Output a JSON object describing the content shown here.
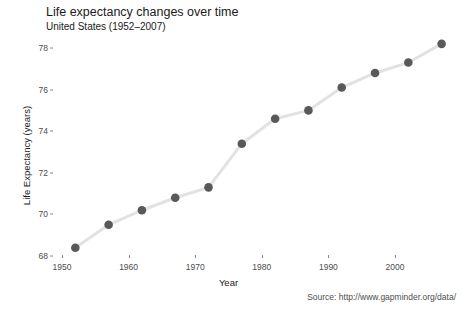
{
  "chart_data": {
    "type": "line",
    "title": "Life expectancy changes over time",
    "subtitle": "United States (1952–2007)",
    "caption": "Source: http://www.gapminder.org/data/",
    "xlabel": "Year",
    "ylabel": "Life Expectancy (years)",
    "x": [
      1952,
      1957,
      1962,
      1967,
      1972,
      1977,
      1982,
      1987,
      1992,
      1997,
      2002,
      2007
    ],
    "values": [
      68.4,
      69.5,
      70.2,
      70.8,
      71.3,
      73.4,
      74.6,
      75.0,
      76.1,
      76.8,
      77.3,
      78.2
    ],
    "series": [
      {
        "name": "United States",
        "values": [
          68.4,
          69.5,
          70.2,
          70.8,
          71.3,
          73.4,
          74.6,
          75.0,
          76.1,
          76.8,
          77.3,
          78.2
        ]
      }
    ],
    "xlim": [
      1950,
      2008.5
    ],
    "ylim": [
      67.8,
      78.6
    ],
    "x_ticks": [
      1950,
      1960,
      1970,
      1980,
      1990,
      2000
    ],
    "y_ticks": [
      68,
      70,
      72,
      74,
      76,
      78
    ],
    "grid": false,
    "legend": "none",
    "point_color": "#595959",
    "line_color": "#e2e2e2"
  },
  "axis": {
    "x_tick_labels": [
      "1950",
      "1960",
      "1970",
      "1980",
      "1990",
      "2000"
    ],
    "y_tick_labels": [
      "68",
      "70",
      "72",
      "74",
      "76",
      "78"
    ]
  }
}
